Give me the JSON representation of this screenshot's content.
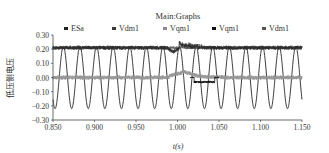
{
  "chart_data": {
    "type": "line",
    "title": "Main:Graphs",
    "xlabel": "t(s)",
    "ylabel": "低压侧电压",
    "xlim": [
      0.85,
      1.15
    ],
    "ylim": [
      -0.3,
      0.3
    ],
    "x_ticks": [
      "0.850",
      "0.900",
      "0.950",
      "1.000",
      "1.050",
      "1.100",
      "1.150"
    ],
    "y_ticks": [
      "0.30",
      "0.20",
      "0.10",
      "0.00",
      "-0.10",
      "-0.20",
      "-0.30"
    ],
    "grid": false,
    "legend_position": "top",
    "legend": [
      "ESa",
      "Vdm1",
      "Vqm1",
      "Vqm1",
      "Vdm1"
    ],
    "series": [
      {
        "name": "ESa",
        "kind": "sinusoid",
        "amplitude": 0.22,
        "frequency_hz": 50,
        "color": "#222222"
      },
      {
        "name": "Vdm1",
        "kind": "noisy-band",
        "level": 0.21,
        "noise": 0.015,
        "color": "#3a3a3a",
        "disturbance": {
          "t": 1.0,
          "dip": -0.03,
          "then_rise": 0.02
        }
      },
      {
        "name": "Vqm1",
        "kind": "noisy-band",
        "level": 0.0,
        "noise": 0.015,
        "color": "#8a8a8a",
        "disturbance": {
          "t": 1.005,
          "peak": 0.03
        }
      },
      {
        "name": "Vqm1",
        "kind": "transient",
        "level": 0.0,
        "color": "#111111",
        "disturbance": {
          "t_start": 1.02,
          "t_end": 1.045,
          "dip": -0.04
        }
      },
      {
        "name": "Vdm1",
        "kind": "noisy-band",
        "level": 0.21,
        "noise": 0.01,
        "color": "#555555"
      }
    ]
  }
}
